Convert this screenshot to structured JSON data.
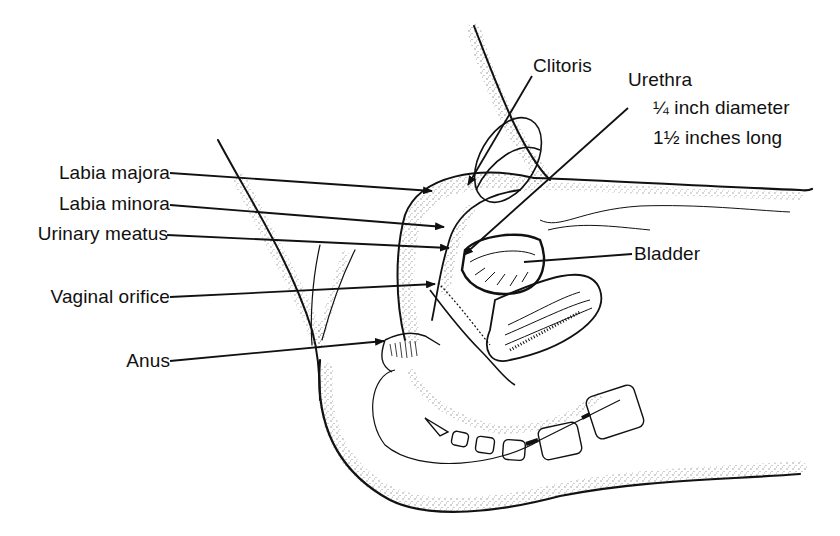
{
  "diagram": {
    "ink_color": "#111111",
    "background": "#ffffff"
  },
  "labels": {
    "clitoris": "Clitoris",
    "urethra": "Urethra",
    "urethra_diameter": "¼ inch diameter",
    "urethra_length": "1½ inches long",
    "labia_majora": "Labia majora",
    "labia_minora": "Labia minora",
    "urinary_meatus": "Urinary meatus",
    "bladder": "Bladder",
    "vaginal_orifice": "Vaginal orifice",
    "anus": "Anus"
  }
}
